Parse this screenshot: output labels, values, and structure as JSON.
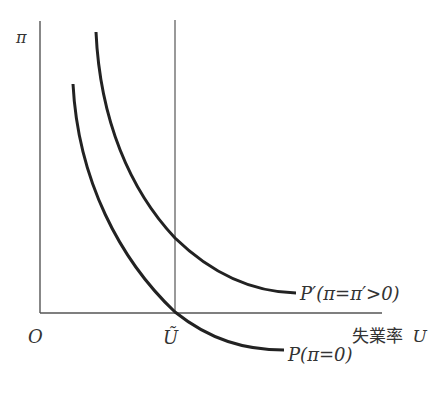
{
  "diagram": {
    "type": "phillips-curve",
    "colors": {
      "axis": "#555555",
      "curve": "#222222",
      "text": "#333333",
      "background": "#ffffff"
    },
    "labels": {
      "y_axis": "π",
      "origin": "O",
      "u_tilde": "Ũ",
      "x_axis": "失業率 U",
      "x_axis_jp": "失業率",
      "x_axis_var": "U",
      "curve_p_prime": "P′(π=π′>0)",
      "curve_p": "P(π=0)"
    },
    "curves": [
      {
        "name": "P′",
        "label": "P′(π=π′>0)",
        "description": "Phillips curve with expected inflation π′>0"
      },
      {
        "name": "P",
        "label": "P(π=0)",
        "description": "Phillips curve with zero expected inflation"
      }
    ],
    "reference_line": {
      "name": "Ũ",
      "description": "natural rate of unemployment"
    }
  }
}
